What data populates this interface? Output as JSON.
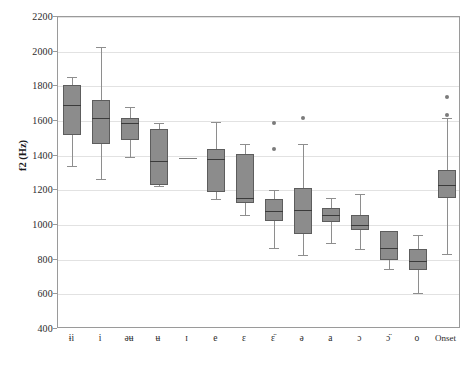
{
  "chart_data": {
    "type": "box",
    "title": "",
    "xlabel": "",
    "ylabel": "f2 (Hz)",
    "ylim": [
      400,
      2200
    ],
    "ytick_step": 200,
    "yticks": [
      2200,
      2000,
      1800,
      1600,
      1400,
      1200,
      1000,
      800,
      600,
      400
    ],
    "grid": "horizontal",
    "legend": "none",
    "categories": [
      "ɨi",
      "i",
      "əʉ",
      "ʉ",
      "ɪ",
      "e",
      "ɛ",
      "ɛ̈",
      "ə",
      "a",
      "ɔ",
      "ɔ̈",
      "o",
      "Onset"
    ],
    "boxes": [
      {
        "category": "ɨi",
        "whisker_low": 1340,
        "q1": 1520,
        "median": 1695,
        "q3": 1805,
        "whisker_high": 1855,
        "outliers": []
      },
      {
        "category": "i",
        "whisker_low": 1265,
        "q1": 1470,
        "median": 1615,
        "q3": 1720,
        "whisker_high": 2025,
        "outliers": []
      },
      {
        "category": "əʉ",
        "whisker_low": 1395,
        "q1": 1490,
        "median": 1590,
        "q3": 1620,
        "whisker_high": 1680,
        "outliers": []
      },
      {
        "category": "ʉ",
        "whisker_low": 1225,
        "q1": 1230,
        "median": 1370,
        "q3": 1555,
        "whisker_high": 1590,
        "outliers": []
      },
      {
        "category": "ɪ",
        "whisker_low": 1385,
        "q1": 1385,
        "median": 1385,
        "q3": 1385,
        "whisker_high": 1385,
        "outliers": []
      },
      {
        "category": "e",
        "whisker_low": 1150,
        "q1": 1190,
        "median": 1380,
        "q3": 1440,
        "whisker_high": 1595,
        "outliers": []
      },
      {
        "category": "ɛ",
        "whisker_low": 1060,
        "q1": 1125,
        "median": 1155,
        "q3": 1410,
        "whisker_high": 1465,
        "outliers": []
      },
      {
        "category": "ɛ̈",
        "whisker_low": 865,
        "q1": 1025,
        "median": 1080,
        "q3": 1150,
        "whisker_high": 1200,
        "outliers": [
          1590,
          1440
        ]
      },
      {
        "category": "ə",
        "whisker_low": 825,
        "q1": 950,
        "median": 1085,
        "q3": 1215,
        "whisker_high": 1465,
        "outliers": [
          1615
        ]
      },
      {
        "category": "a",
        "whisker_low": 895,
        "q1": 1020,
        "median": 1060,
        "q3": 1100,
        "whisker_high": 1155,
        "outliers": []
      },
      {
        "category": "ɔ",
        "whisker_low": 860,
        "q1": 970,
        "median": 1000,
        "q3": 1055,
        "whisker_high": 1180,
        "outliers": []
      },
      {
        "category": "ɔ̈",
        "whisker_low": 745,
        "q1": 800,
        "median": 865,
        "q3": 965,
        "whisker_high": 965,
        "outliers": []
      },
      {
        "category": "o",
        "whisker_low": 605,
        "q1": 740,
        "median": 790,
        "q3": 860,
        "whisker_high": 940,
        "outliers": []
      },
      {
        "category": "Onset",
        "whisker_low": 835,
        "q1": 1155,
        "median": 1230,
        "q3": 1315,
        "whisker_high": 1620,
        "outliers": [
          1740,
          1635
        ]
      }
    ],
    "colors": {
      "box_fill": "#8c8c8c",
      "box_edge": "#5d5d5d",
      "median": "#3b3b3b",
      "whisker": "#8e8e8e",
      "outlier": "#7b7b7b",
      "grid": "#e2e2e2",
      "frame": "#9a9a9a",
      "background": "#ffffff"
    }
  }
}
